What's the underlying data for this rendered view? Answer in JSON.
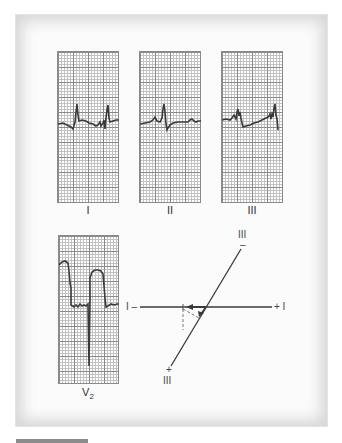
{
  "figure": {
    "leads": [
      {
        "id": "lead-i",
        "label": "I"
      },
      {
        "id": "lead-ii",
        "label": "II"
      },
      {
        "id": "lead-iii",
        "label": "III"
      }
    ],
    "precordial": {
      "label_main": "V",
      "label_sub": "2"
    },
    "axis_diagram": {
      "lead_i_negative": "I –",
      "lead_i_positive": "+ I",
      "lead_iii_negative_label": "III",
      "lead_iii_negative_sign": "–",
      "lead_iii_positive_label": "III",
      "lead_iii_positive_sign": "+"
    }
  },
  "colors": {
    "trace": "#3a3a3a",
    "grid_major": "#8a8a8a",
    "grid_minor": "#c2c2c2",
    "frame_shadow": "#d6d6d6",
    "footer_bar": "#8c8c8c"
  }
}
